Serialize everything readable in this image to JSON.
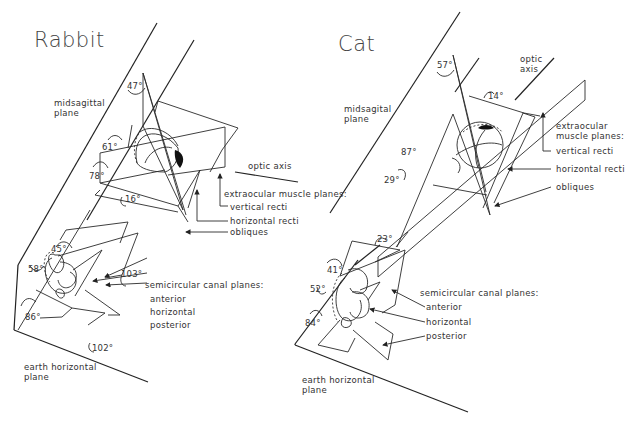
{
  "panels": {
    "rabbit": {
      "title": "Rabbit",
      "midsagittal_label": "midsagittal\nplane",
      "optic_axis_label": "optic axis",
      "extraocular_heading": "extraocular muscle planes:",
      "extraocular_items": [
        "vertical recti",
        "horizontal recti",
        "obliques"
      ],
      "canal_heading": "semicircular canal planes:",
      "canal_items": [
        "anterior",
        "horizontal",
        "posterior"
      ],
      "earth_label": "earth horizontal\nplane",
      "angles": {
        "a47": "47°",
        "a61": "61°",
        "a78": "78°",
        "a16": "16°",
        "a45": "45°",
        "a58": "58°",
        "a103": "103°",
        "a86": "86°",
        "a102": "102°"
      }
    },
    "cat": {
      "title": "Cat",
      "midsagittal_label": "midsagital\nplane",
      "optic_axis_label": "optic\naxis",
      "extraocular_heading": "extraocular\nmuscle planes:",
      "extraocular_items": [
        "vertical recti",
        "horizontal recti",
        "obliques"
      ],
      "canal_heading": "semicircular canal planes:",
      "canal_items": [
        "anterior",
        "horizontal",
        "posterior"
      ],
      "earth_label": "earth horizontal\nplane",
      "angles": {
        "a57": "57°",
        "a14": "14°",
        "a87": "87°",
        "a29": "29°",
        "a23": "23°",
        "a41": "41°",
        "a52": "52°",
        "a84": "84°"
      }
    }
  }
}
